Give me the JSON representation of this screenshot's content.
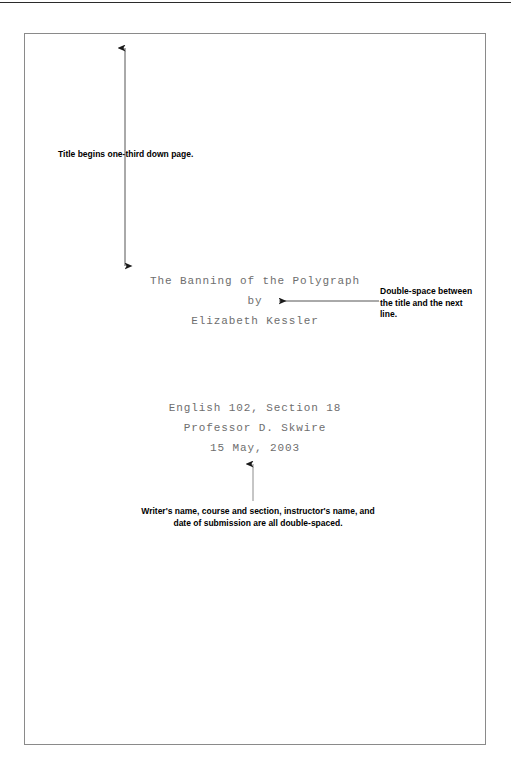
{
  "document": {
    "kind": "title-page-format-example",
    "manuscript": {
      "title": "The Banning of the Polygraph",
      "byline": "by",
      "author": "Elizabeth Kessler",
      "course": "English 102, Section 18",
      "instructor": "Professor D. Skwire",
      "date": "15 May, 2003"
    },
    "annotations": {
      "title_position": "Title begins one-third down page.",
      "double_space_title": "Double-space between the title and the next line.",
      "all_double_spaced": "Writer's name, course and section, instructor's name, and date of submission are all double-spaced."
    }
  },
  "colors": {
    "manuscript_text": "#6e6e6e",
    "annotation_text": "#000000",
    "paper_border": "#8a8a8a",
    "frame_rule": "#2b2b2b",
    "arrow": "#1a1a1a"
  }
}
